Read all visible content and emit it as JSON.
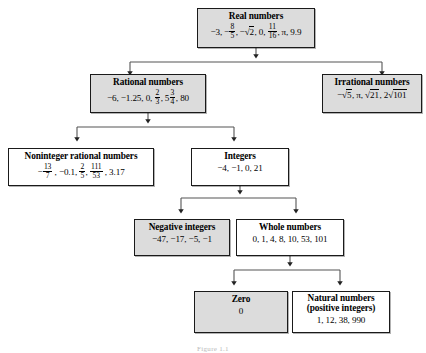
{
  "figure": {
    "caption": "Figure 1.1"
  },
  "colors": {
    "shaded_fill": "#dcdcdc",
    "plain_fill": "#ffffff",
    "border": "#1a1a1a",
    "connector": "#555555"
  },
  "nodes": {
    "real": {
      "title": "Real numbers",
      "values_plain": "-3, -8/5, -√2, 0, 11/16, π, 9.9",
      "shaded": "true"
    },
    "rational": {
      "title": "Rational numbers",
      "values_plain": "-6, -1.25, 0, 2/3, 5 3/4, 80",
      "shaded": "true"
    },
    "irrational": {
      "title": "Irrational numbers",
      "values_plain": "-√5, π, √21, 2√101",
      "shaded": "true"
    },
    "noninteger": {
      "title": "Noninteger rational numbers",
      "values_plain": "-13/7, -0.1, 2/5, 111/53, 3.17",
      "shaded": "false"
    },
    "integers": {
      "title": "Integers",
      "values_plain": "-4, -1, 0, 21",
      "shaded": "false"
    },
    "negative": {
      "title": "Negative integers",
      "values_plain": "-47, -17, -5, -1",
      "shaded": "true"
    },
    "whole": {
      "title": "Whole numbers",
      "values_plain": "0, 1, 4, 8, 10, 53, 101",
      "shaded": "false"
    },
    "zero": {
      "title": "Zero",
      "values_plain": "0",
      "shaded": "true"
    },
    "natural": {
      "title_line1": "Natural numbers",
      "title_line2": "(positive integers)",
      "values_plain": "1, 12, 38, 990",
      "shaded": "false"
    }
  },
  "edges": [
    {
      "from": "real",
      "to": "rational"
    },
    {
      "from": "real",
      "to": "irrational"
    },
    {
      "from": "rational",
      "to": "noninteger"
    },
    {
      "from": "rational",
      "to": "integers"
    },
    {
      "from": "integers",
      "to": "negative"
    },
    {
      "from": "integers",
      "to": "whole"
    },
    {
      "from": "whole",
      "to": "zero"
    },
    {
      "from": "whole",
      "to": "natural"
    }
  ]
}
